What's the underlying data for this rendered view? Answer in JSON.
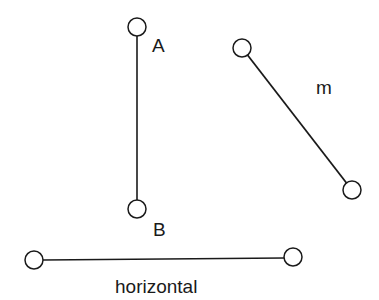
{
  "diagram": {
    "stroke_color": "#1a1a1a",
    "background": "#ffffff",
    "segments": [
      {
        "name": "vertical-segment-AB",
        "x1": 137,
        "y1": 27,
        "x2": 137,
        "y2": 209
      },
      {
        "name": "segment-m",
        "x1": 242,
        "y1": 48,
        "x2": 352,
        "y2": 190
      },
      {
        "name": "horizontal-segment",
        "x1": 34,
        "y1": 260,
        "x2": 293,
        "y2": 258
      }
    ],
    "labels": {
      "A": "A",
      "B": "B",
      "m": "m",
      "horizontal": "horizontal"
    }
  }
}
